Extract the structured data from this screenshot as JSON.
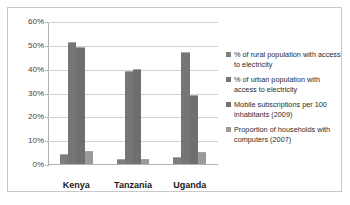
{
  "chart_data": {
    "type": "bar",
    "title": "",
    "xlabel": "",
    "ylabel": "",
    "ylim": [
      0,
      60
    ],
    "grid": true,
    "legend_position": "right",
    "categories": [
      "Kenya",
      "Tanzania",
      "Uganda"
    ],
    "ytick_labels": [
      "60%",
      "50%",
      "40%",
      "30%",
      "20%",
      "10%",
      "0%"
    ],
    "ytick_values": [
      60,
      50,
      40,
      30,
      20,
      10,
      0
    ],
    "series": [
      {
        "name": "% of rural population with access to electricity",
        "values": [
          4,
          2,
          3
        ],
        "color": "#7e7e7e"
      },
      {
        "name": "% of urban population with access to electricity",
        "values": [
          51,
          39,
          47
        ],
        "color": "#757575"
      },
      {
        "name": "Mobile subscriptions per 100 inhabitants (2009)",
        "values": [
          49,
          40,
          29
        ],
        "color": "#6f6f6f"
      },
      {
        "name": "Proportion of households with computers (2007)",
        "values": [
          5.5,
          2,
          5
        ],
        "color": "#9a9a9a"
      }
    ]
  },
  "legend": {
    "items": [
      "% of rural population with access to electricity",
      "% of urban population with access to electricity",
      "Mobile subscriptions per 100 inhabitants (2009)",
      "Proportion of households with computers (2007)"
    ]
  },
  "axis": {
    "y_ticks": [
      "60%",
      "50%",
      "40%",
      "30%",
      "20%",
      "10%",
      "0%"
    ],
    "x_ticks": [
      "Kenya",
      "Tanzania",
      "Uganda"
    ]
  }
}
